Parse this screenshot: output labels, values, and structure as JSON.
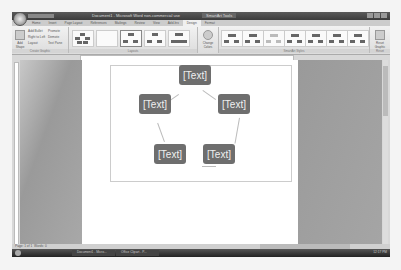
{
  "window": {
    "title": "Document1 - Microsoft Word non-commercial use",
    "contextual_tab_group": "SmartArt Tools",
    "controls": [
      "minimize",
      "restore",
      "close"
    ]
  },
  "ribbon": {
    "tabs": [
      {
        "label": "Home",
        "active": false
      },
      {
        "label": "Insert",
        "active": false
      },
      {
        "label": "Page Layout",
        "active": false
      },
      {
        "label": "References",
        "active": false
      },
      {
        "label": "Mailings",
        "active": false
      },
      {
        "label": "Review",
        "active": false
      },
      {
        "label": "View",
        "active": false
      },
      {
        "label": "Add-Ins",
        "active": false
      },
      {
        "label": "Design",
        "active": true
      },
      {
        "label": "Format",
        "active": false
      }
    ],
    "create_graphic": {
      "label": "Create Graphic",
      "add_shape": "Add Shape",
      "add_bullet": "Add Bullet",
      "right_to_left": "Right to Left",
      "layout": "Layout",
      "promote": "Promote",
      "demote": "Demote",
      "text_pane": "Text Pane"
    },
    "layouts": {
      "label": "Layouts"
    },
    "change_colors": "Change Colors",
    "smartart_styles": {
      "label": "SmartArt Styles"
    },
    "reset": {
      "label": "Reset",
      "reset_graphic": "Reset Graphic"
    }
  },
  "document": {
    "smartart": {
      "type": "cycle",
      "nodes": [
        "[Text]",
        "[Text]",
        "[Text]",
        "[Text]",
        "[Text]"
      ]
    }
  },
  "statusbar": {
    "page": "Page: 1 of 1",
    "words": "Words: 0"
  },
  "taskbar": {
    "items": [
      "Document1 - Micro...",
      "Office Clipart - P..."
    ],
    "clock": "12:17 PM"
  }
}
